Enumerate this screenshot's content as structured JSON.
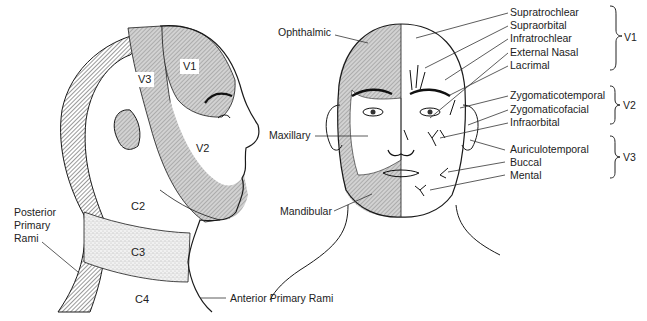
{
  "diagram": {
    "type": "anatomical",
    "lateral_view": {
      "zones": [
        {
          "id": "V1",
          "label": "V1"
        },
        {
          "id": "V2",
          "label": "V2"
        },
        {
          "id": "V3",
          "label": "V3"
        },
        {
          "id": "C2",
          "label": "C2"
        },
        {
          "id": "C3",
          "label": "C3"
        },
        {
          "id": "C4",
          "label": "C4"
        }
      ],
      "callouts": {
        "posterior": [
          "Posterior",
          "Primary",
          "Rami"
        ],
        "anterior": "Anterior Primary Rami"
      }
    },
    "frontal_view": {
      "left_labels": {
        "ophthalmic": "Ophthalmic",
        "maxillary": "Maxillary",
        "mandibular": "Mandibular"
      },
      "nerve_groups": [
        {
          "division": "V1",
          "nerves": [
            "Supratrochlear",
            "Supraorbital",
            "Infratrochlear",
            "External Nasal",
            "Lacrimal"
          ]
        },
        {
          "division": "V2",
          "nerves": [
            "Zygomaticotemporal",
            "Zygomaticofacial",
            "Infraorbital"
          ]
        },
        {
          "division": "V3",
          "nerves": [
            "Auriculotemporal",
            "Buccal",
            "Mental"
          ]
        }
      ]
    },
    "colors": {
      "line": "#1a1a1a",
      "hatch_fill": "#bdbdbd",
      "stipple_fill": "#e2e2e2",
      "background": "#ffffff"
    }
  }
}
